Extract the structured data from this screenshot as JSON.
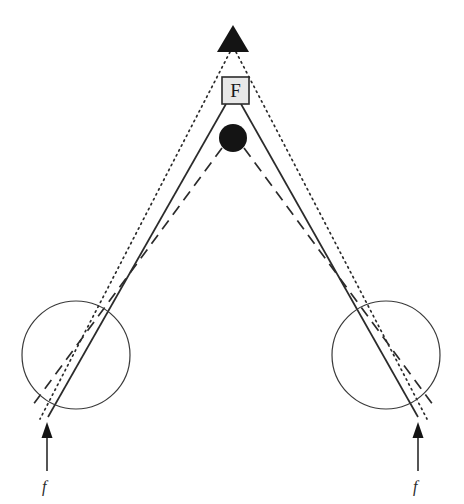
{
  "figure": {
    "type": "optical-ray-diagram",
    "background_color": "#ffffff",
    "stroke_color": "#2b2b2b",
    "fill_black": "#141414",
    "box_fill": "#e8e8e8",
    "width": 464,
    "height": 504
  },
  "apex_marker": {
    "name": "triangle-source",
    "shape": "filled-triangle",
    "color": "#141414",
    "cx": 233,
    "apex_y": 25,
    "base_y": 52,
    "half_width": 15
  },
  "f_box": {
    "label": "F",
    "x": 222,
    "y": 77,
    "size": 27,
    "fill": "#e8e8e8",
    "stroke": "#2b2b2b"
  },
  "point_object": {
    "name": "filled-circle-object",
    "cx": 233,
    "cy": 138,
    "r": 14,
    "color": "#141414"
  },
  "lenses": [
    {
      "name": "left-lens",
      "cx": 76,
      "cy": 355,
      "r": 54,
      "stroke": "#2b2b2b"
    },
    {
      "name": "right-lens",
      "cx": 386,
      "cy": 355,
      "r": 54,
      "stroke": "#2b2b2b"
    }
  ],
  "rays": {
    "dotted": {
      "style": "dotted",
      "origin_label": "triangle-apex",
      "dasharray": "1.5 4",
      "left": {
        "x1": 230,
        "y1": 52,
        "x2": 40,
        "y2": 419
      },
      "right": {
        "x1": 236,
        "y1": 52,
        "x2": 427,
        "y2": 419
      }
    },
    "solid": {
      "style": "solid",
      "origin_label": "f-box",
      "dasharray": "none",
      "left": {
        "x1": 226,
        "y1": 104,
        "x2": 48,
        "y2": 417
      },
      "right": {
        "x1": 241,
        "y1": 104,
        "x2": 418,
        "y2": 417
      }
    },
    "dashed": {
      "style": "dashed",
      "origin_label": "point-object",
      "dasharray": "11 7",
      "left": {
        "x1": 222,
        "y1": 148,
        "x2": 30,
        "y2": 409
      },
      "right": {
        "x1": 244,
        "y1": 148,
        "x2": 436,
        "y2": 409
      }
    }
  },
  "arrows": [
    {
      "name": "left-focal-arrow",
      "x": 47,
      "tail_y": 471,
      "head_y": 424,
      "label": "f"
    },
    {
      "name": "right-focal-arrow",
      "x": 418,
      "tail_y": 471,
      "head_y": 424,
      "label": "f"
    }
  ],
  "labels": {
    "left_focal": "f",
    "right_focal": "f",
    "left_focal_x": 42,
    "left_focal_y": 492,
    "right_focal_x": 413,
    "right_focal_y": 492
  }
}
